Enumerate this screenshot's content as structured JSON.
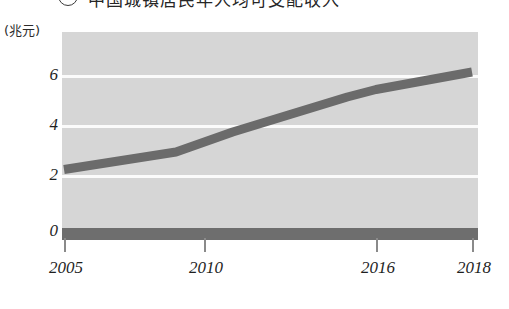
{
  "figure": {
    "marker": "3",
    "title": "中国城镇居民年人均可支配收入",
    "unit_label": "(兆元)"
  },
  "chart_data": {
    "type": "line",
    "title": "中国城镇居民年人均可支配收入",
    "xlabel": "",
    "ylabel": "(兆元)",
    "ylim": [
      0,
      7
    ],
    "xlim": [
      2005,
      2018
    ],
    "grid": true,
    "gridlines": [
      2,
      4,
      6
    ],
    "legend": "none",
    "yticks": [
      "0",
      "2",
      "4",
      "6"
    ],
    "ytick_values": [
      0,
      2,
      4,
      6
    ],
    "xticks": [
      "2005",
      "2010",
      "2016",
      "2018"
    ],
    "xtick_values": [
      2005,
      2010,
      2016,
      2018
    ],
    "series": [
      {
        "name": "收入",
        "color": "#6b6b6b",
        "x": [
          2005,
          2007,
          2009,
          2011,
          2013,
          2015,
          2016,
          2018
        ],
        "values": [
          2.5,
          2.85,
          3.2,
          4.0,
          4.7,
          5.4,
          5.7,
          6.4
        ]
      }
    ]
  },
  "colors": {
    "panel_background": "#d6d6d6",
    "gridline": "#fbfbfb",
    "line": "#6b6b6b",
    "baseline": "#6e6e6e",
    "text": "#1f1f1f"
  }
}
